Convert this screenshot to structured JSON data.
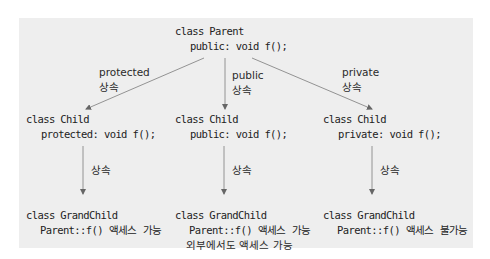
{
  "diagram": {
    "parent": {
      "class_line": "class Parent",
      "member_line": "public: void f();"
    },
    "branches": [
      {
        "inherit_mode": "protected",
        "inherit_word": "상속",
        "child_class": "class Child",
        "child_member": "protected: void f();",
        "child_inherit_word": "상속",
        "grandchild_class": "class GrandChild",
        "grandchild_note_1": "Parent::f() 액세스 가능",
        "grandchild_note_2": ""
      },
      {
        "inherit_mode": "public",
        "inherit_word": "상속",
        "child_class": "class Child",
        "child_member": "public: void f();",
        "child_inherit_word": "상속",
        "grandchild_class": "class GrandChild",
        "grandchild_note_1": "Parent::f() 액세스 가능",
        "grandchild_note_2": "외부에서도 액세스 가능"
      },
      {
        "inherit_mode": "private",
        "inherit_word": "상속",
        "child_class": "class Child",
        "child_member": "private: void f();",
        "child_inherit_word": "상속",
        "grandchild_class": "class GrandChild",
        "grandchild_note_1": "Parent::f() 액세스 불가능",
        "grandchild_note_2": ""
      }
    ],
    "colors": {
      "panel_bg": "#eeeeee",
      "arrow": "#777777",
      "text": "#222222"
    }
  }
}
